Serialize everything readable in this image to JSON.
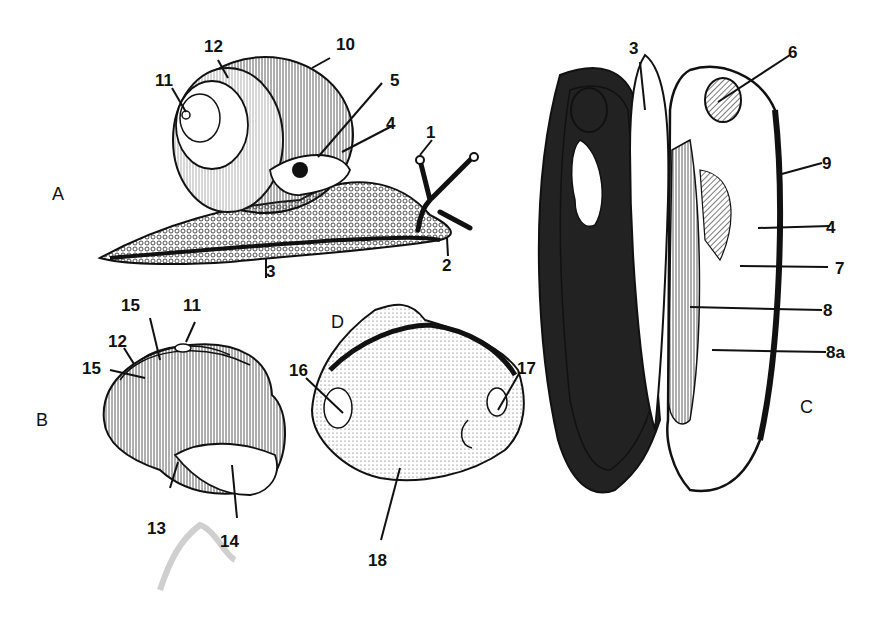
{
  "figure": {
    "panels": [
      {
        "id": "A",
        "label": "A",
        "subject": "land snail"
      },
      {
        "id": "B",
        "label": "B",
        "subject": "snail shell"
      },
      {
        "id": "C",
        "label": "C",
        "subject": "opened bivalve"
      },
      {
        "id": "D",
        "label": "D",
        "subject": "bivalve valve interior"
      }
    ],
    "labels": {
      "A": [
        "1",
        "2",
        "3",
        "4",
        "5",
        "10",
        "11",
        "12"
      ],
      "B": [
        "11",
        "12",
        "13",
        "14",
        "15",
        "15"
      ],
      "C": [
        "3",
        "4",
        "6",
        "7",
        "8",
        "8a",
        "9"
      ],
      "D": [
        "16",
        "17",
        "18"
      ]
    },
    "colors": {
      "ink": "#111111",
      "paper": "#ffffff",
      "shade": "#444444",
      "smudge": "#bbbbbb"
    }
  }
}
